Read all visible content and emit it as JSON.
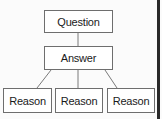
{
  "diagram": {
    "type": "tree",
    "root": {
      "label": "Question"
    },
    "middle": {
      "label": "Answer"
    },
    "leaves": [
      {
        "label": "Reason"
      },
      {
        "label": "Reason"
      },
      {
        "label": "Reason"
      }
    ],
    "edges": [
      [
        "Question",
        "Answer"
      ],
      [
        "Answer",
        "Reason 1"
      ],
      [
        "Answer",
        "Reason 2"
      ],
      [
        "Answer",
        "Reason 3"
      ]
    ],
    "colors": {
      "border": "#6e6e6e",
      "line": "#7a7a7a",
      "text": "#1a1a1a",
      "background": "#fbfbfb"
    }
  }
}
